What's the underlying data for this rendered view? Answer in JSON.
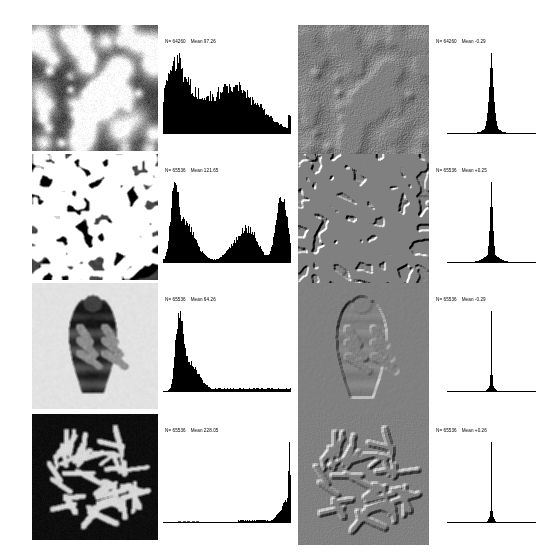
{
  "figure": {
    "columns": [
      {
        "id": "original-image",
        "label": "Original image"
      },
      {
        "id": "original-histogram",
        "label": "Original histogram"
      },
      {
        "id": "filtered-image",
        "label": "Difference-filtered image"
      },
      {
        "id": "filtered-histogram",
        "label": "Filtered histogram"
      }
    ],
    "background_color": "#ffffff",
    "image_background_gray": "#8a8a8a",
    "ink_color": "#000000"
  },
  "rows": [
    {
      "id": "row-bubbles",
      "subject": "bubble-cluster-texture",
      "original": {
        "image_name": "bubble-cluster-image",
        "seed": 11,
        "kind": "blobs",
        "params": {
          "blobs": 70,
          "blur": 2.4,
          "bg": 70,
          "contrast": 1.0
        }
      },
      "original_histogram": {
        "name": "histogram-original-row1",
        "n_label": "N= 64260",
        "mean_label": "Mean 97.26",
        "n_value": 64260,
        "mean_value": 97.26,
        "type": "bar",
        "xlim": [
          0,
          255
        ],
        "shape": "broad-bimodal-decaying",
        "peaks": [
          {
            "center": 18,
            "height": 0.92,
            "width": 16
          },
          {
            "center": 42,
            "height": 0.8,
            "width": 26
          },
          {
            "center": 105,
            "height": 0.56,
            "width": 34
          },
          {
            "center": 150,
            "height": 0.62,
            "width": 30
          },
          {
            "center": 200,
            "height": 0.3,
            "width": 30
          }
        ],
        "noise": 0.13,
        "right_spike": {
          "pos": 252,
          "height": 0.33
        }
      },
      "filtered": {
        "image_name": "bubble-cluster-difference-image",
        "seed": 11,
        "kind": "blobs",
        "emboss": true
      },
      "filtered_histogram": {
        "name": "histogram-filtered-row1",
        "n_label": "N= 64260",
        "mean_label": "Mean   -0.29",
        "n_value": 64260,
        "mean_value": -0.29,
        "type": "bar",
        "xlim": [
          -128,
          127
        ],
        "shape": "narrow-unimodal-spike",
        "spike_center": 0.0,
        "spike_sharpness": 16,
        "spike_width": 9,
        "base_width": 26
      }
    },
    {
      "id": "row-microstructure",
      "subject": "alloy-microstructure",
      "original": {
        "image_name": "microstructure-image",
        "seed": 27,
        "kind": "dendrite",
        "params": {
          "blobs": 58,
          "blur": 1.4,
          "bg": 96,
          "contrast": 1.9
        }
      },
      "original_histogram": {
        "name": "histogram-original-row2",
        "n_label": "N= 65536",
        "mean_label": "Mean 121.65",
        "n_value": 65536,
        "mean_value": 121.65,
        "type": "bar",
        "xlim": [
          0,
          255
        ],
        "shape": "bimodal-tall-edges",
        "peaks": [
          {
            "center": 22,
            "height": 1.0,
            "width": 7
          },
          {
            "center": 38,
            "height": 0.52,
            "width": 16
          },
          {
            "center": 60,
            "height": 0.22,
            "width": 18
          },
          {
            "center": 150,
            "height": 0.26,
            "width": 22
          },
          {
            "center": 175,
            "height": 0.36,
            "width": 18
          },
          {
            "center": 232,
            "height": 0.92,
            "width": 9
          },
          {
            "center": 246,
            "height": 0.5,
            "width": 7
          }
        ],
        "noise": 0.1,
        "right_spike": {
          "pos": 253,
          "height": 0.3
        }
      },
      "filtered": {
        "image_name": "microstructure-difference-image",
        "seed": 27,
        "kind": "dendrite",
        "emboss": true
      },
      "filtered_histogram": {
        "name": "histogram-filtered-row2",
        "n_label": "N= 65536",
        "mean_label": "Mean   +0.25",
        "n_value": 65536,
        "mean_value": 0.25,
        "type": "bar",
        "xlim": [
          -128,
          127
        ],
        "shape": "narrow-unimodal-spike",
        "spike_center": 0.0,
        "spike_sharpness": 22,
        "spike_width": 6,
        "base_width": 30
      }
    },
    {
      "id": "row-louse",
      "subject": "head-louse-micrograph",
      "original": {
        "image_name": "louse-image",
        "seed": 5,
        "kind": "louse",
        "params": {
          "bg": 226,
          "body": 36,
          "legs": 120
        }
      },
      "original_histogram": {
        "name": "histogram-original-row3",
        "n_label": "N= 65536",
        "mean_label": "Mean 64.26",
        "n_value": 65536,
        "mean_value": 64.26,
        "type": "bar",
        "xlim": [
          0,
          255
        ],
        "shape": "left-skewed-single-peak",
        "peaks": [
          {
            "center": 28,
            "height": 0.92,
            "width": 6
          },
          {
            "center": 36,
            "height": 1.0,
            "width": 7
          },
          {
            "center": 52,
            "height": 0.52,
            "width": 14
          },
          {
            "center": 72,
            "height": 0.16,
            "width": 16
          }
        ],
        "tail": {
          "from": 95,
          "to": 255,
          "height": 0.055
        },
        "noise": 0.09,
        "right_spike": null
      },
      "filtered": {
        "image_name": "louse-difference-image",
        "seed": 5,
        "kind": "louse",
        "emboss": true
      },
      "filtered_histogram": {
        "name": "histogram-filtered-row3",
        "n_label": "N= 65536",
        "mean_label": "Mean   -0.29",
        "n_value": 65536,
        "mean_value": -0.29,
        "type": "bar",
        "xlim": [
          -128,
          127
        ],
        "shape": "very-narrow-spike",
        "spike_center": 0.0,
        "spike_sharpness": 44,
        "spike_width": 2,
        "base_width": 10
      }
    },
    {
      "id": "row-chromosomes",
      "subject": "chromosome-spread",
      "original": {
        "image_name": "chromosome-image",
        "seed": 42,
        "kind": "chromosomes",
        "params": {
          "count": 46,
          "bg": 8,
          "fg": 215
        }
      },
      "original_histogram": {
        "name": "histogram-original-row4",
        "n_label": "N= 65536",
        "mean_label": "Mean 228.05",
        "n_value": 65536,
        "mean_value": 228.05,
        "type": "bar",
        "xlim": [
          0,
          255
        ],
        "shape": "extreme-right-spike",
        "peaks": [
          {
            "center": 232,
            "height": 0.13,
            "width": 8
          },
          {
            "center": 244,
            "height": 0.26,
            "width": 5
          },
          {
            "center": 252,
            "height": 1.0,
            "width": 2
          }
        ],
        "tail": {
          "from": 150,
          "to": 225,
          "height": 0.022
        },
        "noise": 0.05,
        "baseline_marks": true
      },
      "filtered": {
        "image_name": "chromosome-difference-image",
        "seed": 42,
        "kind": "chromosomes",
        "emboss": true
      },
      "filtered_histogram": {
        "name": "histogram-filtered-row4",
        "n_label": "N= 65536",
        "mean_label": "Mean   +0.26",
        "n_value": 65536,
        "mean_value": 0.26,
        "type": "bar",
        "xlim": [
          -128,
          127
        ],
        "shape": "needle-spike",
        "spike_center": 0.0,
        "spike_sharpness": 60,
        "spike_width": 1,
        "base_width": 9
      }
    }
  ],
  "chart_data": {
    "type": "bar",
    "xlabel": "Brightness value",
    "ylabel": "Pixel count",
    "grid": false,
    "legend": "none",
    "panels": [
      {
        "panel": "row1-original",
        "n": 64260,
        "mean": 97.26,
        "xlim": [
          0,
          255
        ]
      },
      {
        "panel": "row1-filtered",
        "n": 64260,
        "mean": -0.29,
        "xlim": [
          -128,
          127
        ]
      },
      {
        "panel": "row2-original",
        "n": 65536,
        "mean": 121.65,
        "xlim": [
          0,
          255
        ]
      },
      {
        "panel": "row2-filtered",
        "n": 65536,
        "mean": 0.25,
        "xlim": [
          -128,
          127
        ]
      },
      {
        "panel": "row3-original",
        "n": 65536,
        "mean": 64.26,
        "xlim": [
          0,
          255
        ]
      },
      {
        "panel": "row3-filtered",
        "n": 65536,
        "mean": -0.29,
        "xlim": [
          -128,
          127
        ]
      },
      {
        "panel": "row4-original",
        "n": 65536,
        "mean": 228.05,
        "xlim": [
          0,
          255
        ]
      },
      {
        "panel": "row4-filtered",
        "n": 65536,
        "mean": 0.26,
        "xlim": [
          -128,
          127
        ]
      }
    ]
  },
  "layout": {
    "rows_y": [
      25,
      154,
      283,
      414
    ],
    "image_col1_x": 32,
    "image_col1_w": 126,
    "image_col3_x": 298,
    "image_col3_w": 131,
    "hist_col2_x": 163,
    "hist_col2_w": 128,
    "hist_col4_x": 447,
    "hist_col4_w": 89
  }
}
